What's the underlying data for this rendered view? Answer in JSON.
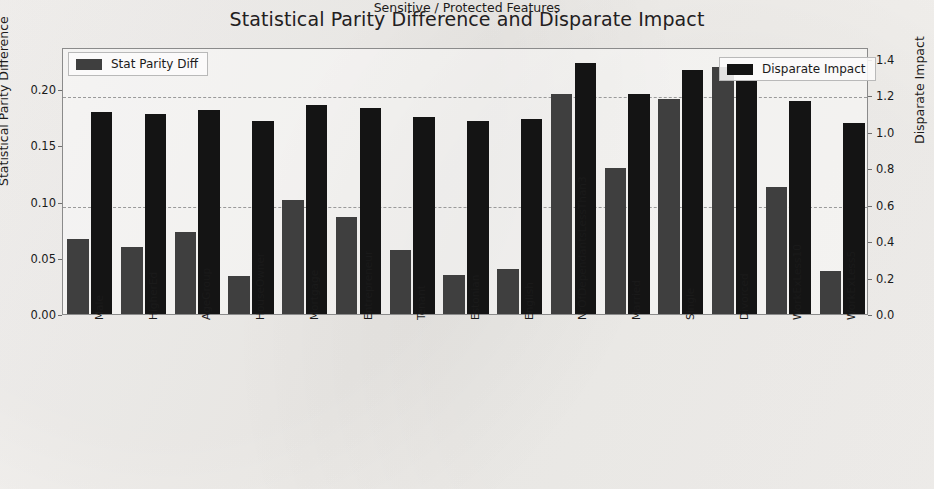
{
  "chart_data": {
    "type": "bar",
    "title": "Statistical Parity Difference and Disparate Impact",
    "xlabel": "Sensitive / Protected Features",
    "ylabel": "Statistical Parity Difference",
    "ylabel_secondary": "Disparate Impact",
    "categories": [
      "Male",
      "HigherEd",
      "AgeGroup",
      "HouseOwner",
      "Mortgage",
      "Entrepreneur",
      "Tenant",
      "Estonian",
      "English",
      "NrOfDependantsLessThan3",
      "Married",
      "Single",
      "Divorced",
      "WorkExLess10",
      "WorkExLess5"
    ],
    "series": [
      {
        "name": "Stat Parity Diff",
        "axis": "left",
        "color": "#3f3f3f",
        "values": [
          0.067,
          0.06,
          0.073,
          0.034,
          0.101,
          0.086,
          0.057,
          0.035,
          0.04,
          0.196,
          0.13,
          0.191,
          0.22,
          0.113,
          0.038
        ]
      },
      {
        "name": "Disparate Impact",
        "axis": "right",
        "color": "#141414",
        "values": [
          1.11,
          1.1,
          1.12,
          1.06,
          1.15,
          1.13,
          1.08,
          1.06,
          1.07,
          1.38,
          1.21,
          1.34,
          1.28,
          1.17,
          1.05
        ]
      }
    ],
    "ylim": [
      0.0,
      0.2375
    ],
    "ylim_secondary": [
      0.0,
      1.466
    ],
    "yticks": [
      "0.00",
      "0.05",
      "0.10",
      "0.15",
      "0.20"
    ],
    "ytick_values": [
      0.0,
      0.05,
      0.1,
      0.15,
      0.2
    ],
    "yticks_secondary": [
      "0.0",
      "0.2",
      "0.4",
      "0.6",
      "0.8",
      "1.0",
      "1.2",
      "1.4"
    ],
    "ytick_values_secondary": [
      0.0,
      0.2,
      0.4,
      0.6,
      0.8,
      1.0,
      1.2,
      1.4
    ],
    "gridlines_at_secondary": [
      0.6,
      1.2
    ],
    "grid": true,
    "legend_position": [
      "upper left",
      "upper right"
    ]
  },
  "legend": {
    "left": {
      "label": "Stat Parity Diff",
      "color": "#3f3f3f"
    },
    "right": {
      "label": "Disparate Impact",
      "color": "#141414"
    }
  }
}
